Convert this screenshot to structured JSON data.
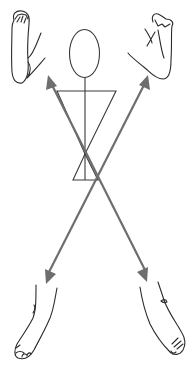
{
  "diagram": {
    "title": "",
    "colors": {
      "background": "#ffffff",
      "line_art": "#2b2b2b",
      "arrows": "#6e6e6e"
    },
    "elements": [
      {
        "id": "foot-sole-top-left",
        "label": ""
      },
      {
        "id": "foot-sole-top-right",
        "label": ""
      },
      {
        "id": "stick-figure",
        "label": ""
      },
      {
        "id": "foot-dorsal-bottom-left",
        "label": ""
      },
      {
        "id": "foot-dorsal-bottom-right",
        "label": ""
      }
    ],
    "arrows": [
      {
        "from": [
          146,
          280
        ],
        "to": [
          48,
          75
        ],
        "direction": "up-left"
      },
      {
        "from": [
          98,
          180
        ],
        "to": [
          148,
          75
        ],
        "direction": "up-right"
      },
      {
        "from": [
          98,
          180
        ],
        "to": [
          48,
          282
        ],
        "direction": "down-left"
      },
      {
        "from": [
          98,
          180
        ],
        "to": [
          146,
          280
        ],
        "direction": "down-right"
      }
    ],
    "caption": ""
  }
}
